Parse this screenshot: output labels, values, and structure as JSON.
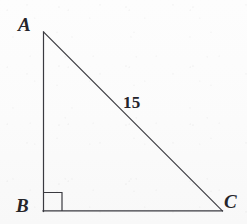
{
  "figure": {
    "kind": "geometry-diagram",
    "shape": "right-triangle",
    "background_color": "#fcfcfc",
    "stroke_color": "#3a3a40",
    "stroke_width": 1,
    "width": 247,
    "height": 224
  },
  "vertices": [
    {
      "name": "A",
      "label": "A",
      "x": 43,
      "y": 32,
      "role": "apex"
    },
    {
      "name": "B",
      "label": "B",
      "x": 43,
      "y": 211,
      "role": "right-angle"
    },
    {
      "name": "C",
      "label": "C",
      "x": 222,
      "y": 211,
      "role": "base-right"
    }
  ],
  "sides": [
    {
      "name": "AB",
      "from": "A",
      "to": "B",
      "label": "",
      "orientation": "vertical"
    },
    {
      "name": "BC",
      "from": "B",
      "to": "C",
      "label": "",
      "orientation": "horizontal"
    },
    {
      "name": "AC",
      "from": "A",
      "to": "C",
      "label": "15",
      "orientation": "hypotenuse"
    }
  ],
  "measures": {
    "hypotenuse_label": "15"
  },
  "right_angle_mark": {
    "at_vertex": "B",
    "size": 18,
    "x": 43,
    "y": 211
  },
  "labels": {
    "A": "A",
    "B": "B",
    "C": "C",
    "hypotenuse": "15"
  }
}
